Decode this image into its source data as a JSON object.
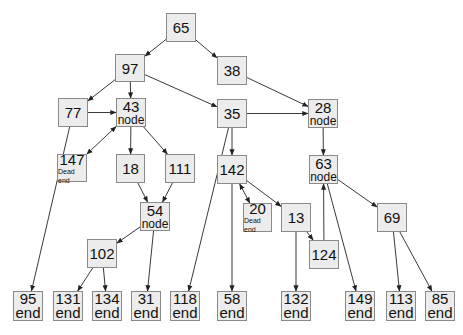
{
  "diagram": {
    "title": "",
    "colors": {
      "box_fill": "#ececec",
      "box_border": "#8a8a8a",
      "edge": "#222222",
      "background": "#ffffff"
    },
    "nodes": [
      {
        "id": "65",
        "label": "65",
        "sub": "",
        "x": 166,
        "y": 13,
        "w": 30,
        "h": 29
      },
      {
        "id": "97",
        "label": "97",
        "sub": "",
        "x": 115,
        "y": 54,
        "w": 30,
        "h": 28
      },
      {
        "id": "38",
        "label": "38",
        "sub": "",
        "x": 217,
        "y": 56,
        "w": 30,
        "h": 29
      },
      {
        "id": "77",
        "label": "77",
        "sub": "",
        "x": 58,
        "y": 98,
        "w": 30,
        "h": 29
      },
      {
        "id": "43",
        "label": "43",
        "sub": "node",
        "x": 116,
        "y": 98,
        "w": 30,
        "h": 29
      },
      {
        "id": "35",
        "label": "35",
        "sub": "",
        "x": 217,
        "y": 99,
        "w": 30,
        "h": 29
      },
      {
        "id": "28",
        "label": "28",
        "sub": "node",
        "x": 308,
        "y": 99,
        "w": 30,
        "h": 29
      },
      {
        "id": "147",
        "label": "147",
        "sub": "Dead end",
        "x": 57,
        "y": 154,
        "w": 30,
        "h": 28
      },
      {
        "id": "18",
        "label": "18",
        "sub": "",
        "x": 116,
        "y": 154,
        "w": 29,
        "h": 29
      },
      {
        "id": "111",
        "label": "111",
        "sub": "",
        "x": 165,
        "y": 154,
        "w": 30,
        "h": 29
      },
      {
        "id": "142",
        "label": "142",
        "sub": "",
        "x": 217,
        "y": 155,
        "w": 30,
        "h": 29
      },
      {
        "id": "63",
        "label": "63",
        "sub": "node",
        "x": 309,
        "y": 155,
        "w": 29,
        "h": 29
      },
      {
        "id": "54",
        "label": "54",
        "sub": "node",
        "x": 140,
        "y": 202,
        "w": 30,
        "h": 29
      },
      {
        "id": "20",
        "label": "20",
        "sub": "Dead end",
        "x": 243,
        "y": 203,
        "w": 29,
        "h": 29
      },
      {
        "id": "13",
        "label": "13",
        "sub": "",
        "x": 281,
        "y": 203,
        "w": 30,
        "h": 29
      },
      {
        "id": "69",
        "label": "69",
        "sub": "",
        "x": 377,
        "y": 203,
        "w": 30,
        "h": 29
      },
      {
        "id": "102",
        "label": "102",
        "sub": "",
        "x": 87,
        "y": 239,
        "w": 30,
        "h": 29
      },
      {
        "id": "124",
        "label": "124",
        "sub": "",
        "x": 309,
        "y": 240,
        "w": 30,
        "h": 29
      },
      {
        "id": "95",
        "label": "95",
        "sub": "end",
        "x": 13,
        "y": 291,
        "w": 30,
        "h": 30
      },
      {
        "id": "131",
        "label": "131",
        "sub": "end",
        "x": 53,
        "y": 291,
        "w": 30,
        "h": 30
      },
      {
        "id": "134",
        "label": "134",
        "sub": "end",
        "x": 92,
        "y": 291,
        "w": 30,
        "h": 30
      },
      {
        "id": "31",
        "label": "31",
        "sub": "end",
        "x": 131,
        "y": 291,
        "w": 30,
        "h": 30
      },
      {
        "id": "118",
        "label": "118",
        "sub": "end",
        "x": 170,
        "y": 291,
        "w": 30,
        "h": 30
      },
      {
        "id": "58",
        "label": "58",
        "sub": "end",
        "x": 217,
        "y": 291,
        "w": 30,
        "h": 30
      },
      {
        "id": "132",
        "label": "132",
        "sub": "end",
        "x": 281,
        "y": 291,
        "w": 30,
        "h": 30
      },
      {
        "id": "149",
        "label": "149",
        "sub": "end",
        "x": 345,
        "y": 291,
        "w": 30,
        "h": 30
      },
      {
        "id": "113",
        "label": "113",
        "sub": "end",
        "x": 386,
        "y": 291,
        "w": 30,
        "h": 30
      },
      {
        "id": "85",
        "label": "85",
        "sub": "end",
        "x": 425,
        "y": 291,
        "w": 30,
        "h": 30
      }
    ],
    "edges": [
      {
        "from": "65",
        "to": "97",
        "bidirectional": false
      },
      {
        "from": "65",
        "to": "38",
        "bidirectional": false
      },
      {
        "from": "97",
        "to": "77",
        "bidirectional": false
      },
      {
        "from": "97",
        "to": "43",
        "bidirectional": false
      },
      {
        "from": "97",
        "to": "35",
        "bidirectional": false
      },
      {
        "from": "38",
        "to": "28",
        "bidirectional": false
      },
      {
        "from": "77",
        "to": "43",
        "bidirectional": false
      },
      {
        "from": "77",
        "to": "95",
        "bidirectional": false
      },
      {
        "from": "43",
        "to": "147",
        "bidirectional": true
      },
      {
        "from": "43",
        "to": "18",
        "bidirectional": false
      },
      {
        "from": "43",
        "to": "111",
        "bidirectional": false
      },
      {
        "from": "35",
        "to": "28",
        "bidirectional": false
      },
      {
        "from": "35",
        "to": "142",
        "bidirectional": false
      },
      {
        "from": "35",
        "to": "118",
        "bidirectional": false
      },
      {
        "from": "28",
        "to": "63",
        "bidirectional": false
      },
      {
        "from": "18",
        "to": "54",
        "bidirectional": false
      },
      {
        "from": "111",
        "to": "54",
        "bidirectional": false
      },
      {
        "from": "54",
        "to": "102",
        "bidirectional": false
      },
      {
        "from": "54",
        "to": "31",
        "bidirectional": false
      },
      {
        "from": "102",
        "to": "131",
        "bidirectional": false
      },
      {
        "from": "102",
        "to": "134",
        "bidirectional": false
      },
      {
        "from": "142",
        "to": "20",
        "bidirectional": true
      },
      {
        "from": "142",
        "to": "13",
        "bidirectional": false
      },
      {
        "from": "142",
        "to": "58",
        "bidirectional": false
      },
      {
        "from": "13",
        "to": "124",
        "bidirectional": false
      },
      {
        "from": "13",
        "to": "132",
        "bidirectional": false
      },
      {
        "from": "124",
        "to": "63",
        "bidirectional": false
      },
      {
        "from": "63",
        "to": "69",
        "bidirectional": false
      },
      {
        "from": "63",
        "to": "149",
        "bidirectional": false
      },
      {
        "from": "69",
        "to": "113",
        "bidirectional": false
      },
      {
        "from": "69",
        "to": "85",
        "bidirectional": false
      }
    ]
  }
}
